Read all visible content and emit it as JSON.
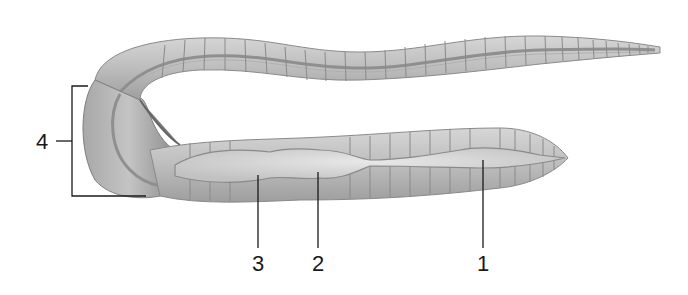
{
  "diagram": {
    "colors": {
      "background": "#ffffff",
      "body_fill": "#c8c8c8",
      "body_shade": "#9a9a9a",
      "segment_line": "#8a8a8a",
      "organ_fill": "#dcdcdc",
      "leader_line": "#1a1a1a",
      "label_text": "#1a1a1a"
    },
    "labels": [
      {
        "id": "1",
        "text": "1",
        "x": 483,
        "y": 258,
        "points_to": [
          483,
          160
        ]
      },
      {
        "id": "2",
        "text": "2",
        "x": 318,
        "y": 258,
        "points_to": [
          318,
          172
        ]
      },
      {
        "id": "3",
        "text": "3",
        "x": 258,
        "y": 258,
        "points_to": [
          258,
          175
        ]
      },
      {
        "id": "4",
        "text": "4",
        "x": 42,
        "y": 133,
        "bracket": {
          "x": 72,
          "top": 86,
          "bottom": 196,
          "right_top": 88,
          "right_bottom": 146
        }
      }
    ]
  }
}
